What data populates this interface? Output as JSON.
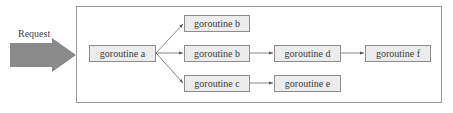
{
  "input": {
    "label": "Request"
  },
  "nodes": [
    {
      "id": "a",
      "label": "goroutine a"
    },
    {
      "id": "b1",
      "label": "goroutine b"
    },
    {
      "id": "b2",
      "label": "goroutine b"
    },
    {
      "id": "c",
      "label": "goroutine c"
    },
    {
      "id": "d",
      "label": "goroutine d"
    },
    {
      "id": "e",
      "label": "goroutine e"
    },
    {
      "id": "f",
      "label": "goroutine f"
    }
  ],
  "edges": [
    {
      "from": "a",
      "to": "b1"
    },
    {
      "from": "a",
      "to": "b2"
    },
    {
      "from": "a",
      "to": "c"
    },
    {
      "from": "b2",
      "to": "d"
    },
    {
      "from": "d",
      "to": "f"
    },
    {
      "from": "c",
      "to": "e"
    }
  ],
  "colors": {
    "arrow_fill": "#8a8a8a",
    "node_fill": "#ececec",
    "node_border": "#8c8c8c",
    "frame_border": "#9a9a9a"
  }
}
